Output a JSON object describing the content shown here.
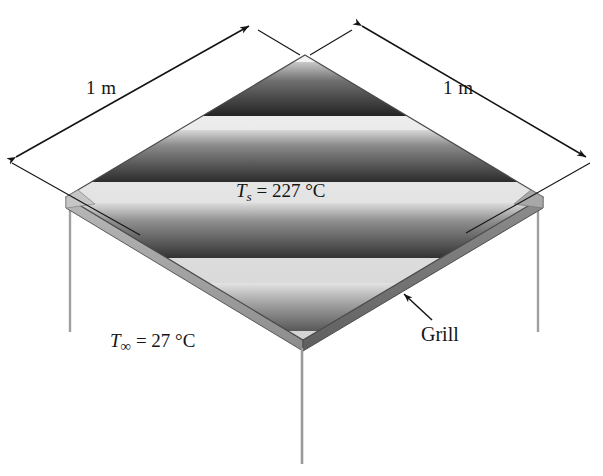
{
  "figure": {
    "type": "isometric-diagram",
    "background_color": "#ffffff",
    "line_color": "#141414"
  },
  "labels": {
    "dim_left": {
      "value": "1",
      "unit": "m",
      "text": "1 m"
    },
    "dim_right": {
      "value": "1",
      "unit": "m",
      "text": "1 m"
    },
    "surface_temp": {
      "symbol": "T",
      "subscript": "s",
      "equals": " = ",
      "value": "227 °C",
      "text": "Ts = 227 °C"
    },
    "ambient_temp": {
      "symbol": "T",
      "subscript": "∞",
      "equals": " = ",
      "value": "27 °C",
      "text": "T∞ = 27 °C"
    },
    "callout": {
      "text": "Grill"
    }
  },
  "plate": {
    "top_face_color_light": "#e8e8e8",
    "top_face_color_mid": "#b4b4b4",
    "stripe_dark": "#2e2e2e",
    "stripe_light": "#f0f0f0",
    "edge_color": "#8f8f8f",
    "edge_color_dark": "#6e6e6e",
    "outline_color": "#4a4a4a",
    "leg_color": "#9a9a9a",
    "stripe_count": 4
  },
  "geometry": {
    "apex_top": [
      305,
      55
    ],
    "corner_left": [
      66,
      197
    ],
    "corner_right": [
      543,
      197
    ],
    "corner_bottom": [
      303,
      340
    ],
    "thickness": 11,
    "legs": [
      {
        "name": "leg-left",
        "x": 70,
        "y_top": 214,
        "y_bottom": 332
      },
      {
        "name": "leg-right",
        "x": 538,
        "y_top": 214,
        "y_bottom": 332
      },
      {
        "name": "leg-bottom",
        "x": 302,
        "y_top": 350,
        "y_bottom": 464
      }
    ]
  },
  "dimensions": [
    {
      "name": "dim-left",
      "from": [
        12,
        160
      ],
      "to": [
        253,
        24
      ],
      "label": "1 m"
    },
    {
      "name": "dim-right",
      "from": [
        358,
        24
      ],
      "to": [
        590,
        160
      ],
      "label": "1 m"
    }
  ]
}
